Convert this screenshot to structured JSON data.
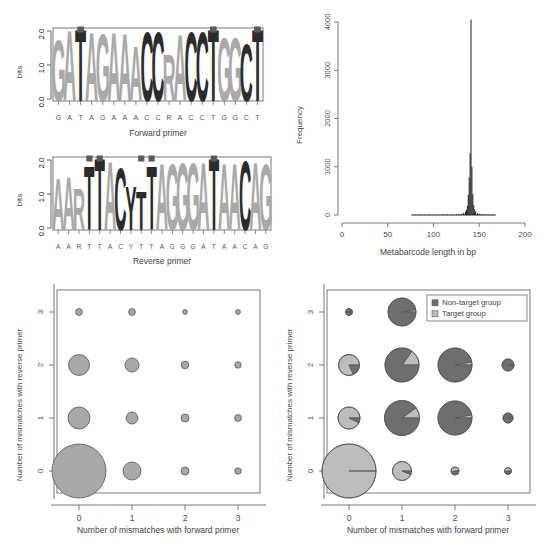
{
  "panel_a": {
    "name": "Forward primer sequence logo",
    "caption": "Forward primer",
    "ylabel": "bits",
    "yticks": [
      "0.0",
      "1.0",
      "2.0"
    ],
    "ylim": [
      0,
      2
    ],
    "sequence": "GATAGAAACCRACCTGGYT",
    "positions": [
      {
        "base": "G",
        "bits": 1.72,
        "color": "gray"
      },
      {
        "base": "A",
        "bits": 1.98,
        "color": "gray"
      },
      {
        "base": "T",
        "bits": 2.0,
        "color": "black",
        "capped": true
      },
      {
        "base": "A",
        "bits": 1.95,
        "color": "gray"
      },
      {
        "base": "G",
        "bits": 1.9,
        "color": "gray"
      },
      {
        "base": "A",
        "bits": 1.92,
        "color": "gray"
      },
      {
        "base": "A",
        "bits": 1.9,
        "color": "gray"
      },
      {
        "base": "A",
        "bits": 1.55,
        "color": "gray"
      },
      {
        "base": "C",
        "bits": 1.95,
        "color": "black"
      },
      {
        "base": "C",
        "bits": 1.92,
        "color": "black"
      },
      {
        "base": "R",
        "bits": 1.3,
        "color": "gray"
      },
      {
        "base": "A",
        "bits": 1.85,
        "color": "gray"
      },
      {
        "base": "C",
        "bits": 1.95,
        "color": "black"
      },
      {
        "base": "C",
        "bits": 1.95,
        "color": "black"
      },
      {
        "base": "T",
        "bits": 2.0,
        "color": "black",
        "capped": true
      },
      {
        "base": "G",
        "bits": 1.8,
        "color": "gray"
      },
      {
        "base": "G",
        "bits": 1.78,
        "color": "gray"
      },
      {
        "base": "C",
        "bits": 1.6,
        "color": "black"
      },
      {
        "base": "T",
        "bits": 2.0,
        "color": "black",
        "capped": true
      }
    ]
  },
  "panel_b": {
    "name": "Reverse primer sequence logo",
    "caption": "Reverse primer",
    "ylabel": "bits",
    "yticks": [
      "0.0",
      "1.0",
      "2.0"
    ],
    "ylim": [
      0,
      2
    ],
    "sequence": "AARTTACYTTAGGGATAACAG",
    "positions": [
      {
        "base": "A",
        "bits": 1.45,
        "color": "gray"
      },
      {
        "base": "A",
        "bits": 1.5,
        "color": "gray"
      },
      {
        "base": "R",
        "bits": 1.15,
        "color": "gray"
      },
      {
        "base": "T",
        "bits": 1.8,
        "color": "black",
        "capped": true
      },
      {
        "base": "T",
        "bits": 2.0,
        "color": "black",
        "capped": true
      },
      {
        "base": "A",
        "bits": 1.95,
        "color": "gray"
      },
      {
        "base": "C",
        "bits": 1.75,
        "color": "black"
      },
      {
        "base": "Y",
        "bits": 1.25,
        "color": "black"
      },
      {
        "base": "T",
        "bits": 1.1,
        "color": "black",
        "capped": true
      },
      {
        "base": "T",
        "bits": 1.8,
        "color": "black",
        "capped": true
      },
      {
        "base": "A",
        "bits": 1.85,
        "color": "gray"
      },
      {
        "base": "G",
        "bits": 1.85,
        "color": "gray"
      },
      {
        "base": "G",
        "bits": 1.9,
        "color": "gray"
      },
      {
        "base": "G",
        "bits": 1.9,
        "color": "gray"
      },
      {
        "base": "A",
        "bits": 1.9,
        "color": "gray"
      },
      {
        "base": "T",
        "bits": 2.0,
        "color": "black",
        "capped": true
      },
      {
        "base": "A",
        "bits": 1.85,
        "color": "gray"
      },
      {
        "base": "A",
        "bits": 1.85,
        "color": "gray"
      },
      {
        "base": "C",
        "bits": 1.95,
        "color": "black"
      },
      {
        "base": "A",
        "bits": 1.9,
        "color": "gray"
      },
      {
        "base": "G",
        "bits": 1.85,
        "color": "gray"
      }
    ]
  },
  "panel_c": {
    "name": "Metabarcode length histogram",
    "xlabel": "Metabarcode length in bp",
    "ylabel": "Frequency",
    "xticks": [
      "0",
      "50",
      "100",
      "150",
      "200"
    ],
    "yticks": [
      "0",
      "1000",
      "2000",
      "3000",
      "4000"
    ],
    "xlim": [
      0,
      200
    ],
    "ylim": [
      0,
      4000
    ],
    "chart_data": {
      "type": "bar",
      "title": "",
      "xlabel": "Metabarcode length in bp",
      "ylabel": "Frequency",
      "xlim": [
        0,
        200
      ],
      "ylim": [
        0,
        4000
      ],
      "grid": false,
      "bin_width": 1,
      "bins": [
        {
          "x": 76,
          "y": 5
        },
        {
          "x": 80,
          "y": 6
        },
        {
          "x": 85,
          "y": 6
        },
        {
          "x": 90,
          "y": 7
        },
        {
          "x": 95,
          "y": 8
        },
        {
          "x": 100,
          "y": 8
        },
        {
          "x": 105,
          "y": 9
        },
        {
          "x": 110,
          "y": 10
        },
        {
          "x": 115,
          "y": 12
        },
        {
          "x": 120,
          "y": 14
        },
        {
          "x": 125,
          "y": 18
        },
        {
          "x": 128,
          "y": 22
        },
        {
          "x": 131,
          "y": 30
        },
        {
          "x": 133,
          "y": 45
        },
        {
          "x": 135,
          "y": 70
        },
        {
          "x": 136,
          "y": 110
        },
        {
          "x": 137,
          "y": 190
        },
        {
          "x": 138,
          "y": 420
        },
        {
          "x": 139,
          "y": 780
        },
        {
          "x": 140,
          "y": 1280
        },
        {
          "x": 141,
          "y": 4050
        },
        {
          "x": 142,
          "y": 1000
        },
        {
          "x": 143,
          "y": 430
        },
        {
          "x": 144,
          "y": 210
        },
        {
          "x": 145,
          "y": 120
        },
        {
          "x": 146,
          "y": 70
        },
        {
          "x": 148,
          "y": 40
        },
        {
          "x": 150,
          "y": 25
        },
        {
          "x": 152,
          "y": 18
        },
        {
          "x": 155,
          "y": 14
        },
        {
          "x": 158,
          "y": 10
        },
        {
          "x": 161,
          "y": 8
        },
        {
          "x": 164,
          "y": 6
        },
        {
          "x": 167,
          "y": 5
        }
      ]
    }
  },
  "panel_d": {
    "name": "Mismatch bubble plot",
    "xlabel": "Number of mismatches with forward primer",
    "ylabel": "Number of mismatches with reverse primer",
    "xticks": [
      "0",
      "1",
      "2",
      "3"
    ],
    "yticks": [
      "0",
      "1",
      "2",
      "3"
    ],
    "chart_data": {
      "type": "scatter",
      "title": "",
      "xlabel": "Number of mismatches with forward primer",
      "ylabel": "Number of mismatches with reverse primer",
      "xlim": [
        0,
        3
      ],
      "ylim": [
        0,
        3
      ],
      "grid": false,
      "marker": "bubble",
      "bubble_color": "#a8a8a8",
      "bubbles": [
        {
          "x": 0,
          "y": 0,
          "r": 27.0
        },
        {
          "x": 1,
          "y": 0,
          "r": 9.0
        },
        {
          "x": 2,
          "y": 0,
          "r": 4.0
        },
        {
          "x": 3,
          "y": 0,
          "r": 3.2
        },
        {
          "x": 0,
          "y": 1,
          "r": 11.0
        },
        {
          "x": 1,
          "y": 1,
          "r": 6.0
        },
        {
          "x": 2,
          "y": 1,
          "r": 4.0
        },
        {
          "x": 3,
          "y": 1,
          "r": 3.4
        },
        {
          "x": 0,
          "y": 2,
          "r": 10.5
        },
        {
          "x": 1,
          "y": 2,
          "r": 7.0
        },
        {
          "x": 2,
          "y": 2,
          "r": 3.8
        },
        {
          "x": 3,
          "y": 2,
          "r": 3.2
        },
        {
          "x": 0,
          "y": 3,
          "r": 3.4
        },
        {
          "x": 1,
          "y": 3,
          "r": 3.4
        },
        {
          "x": 2,
          "y": 3,
          "r": 2.4
        },
        {
          "x": 3,
          "y": 3,
          "r": 2.4
        }
      ]
    }
  },
  "panel_e": {
    "name": "Mismatch pie plot",
    "xlabel": "Number of mismatches with forward primer",
    "ylabel": "Number of mismatches with reverse primer",
    "xticks": [
      "0",
      "1",
      "2",
      "3"
    ],
    "yticks": [
      "0",
      "1",
      "2",
      "3"
    ],
    "legend": {
      "position": "top-right",
      "items": [
        {
          "label": "Non-target group",
          "color": "#6e6e6e"
        },
        {
          "label": "Target group",
          "color": "#bdbdbd"
        }
      ]
    },
    "chart_data": {
      "type": "pie",
      "title": "",
      "xlabel": "Number of mismatches with forward primer",
      "ylabel": "Number of mismatches with reverse primer",
      "xlim": [
        0,
        3
      ],
      "ylim": [
        0,
        3
      ],
      "grid": false,
      "series": [
        {
          "name": "Non-target group",
          "color": "#6e6e6e"
        },
        {
          "name": "Target group",
          "color": "#bdbdbd"
        }
      ],
      "pies": [
        {
          "x": 0,
          "y": 0,
          "r": 27.0,
          "target": 1.0,
          "nontarget": 0.0
        },
        {
          "x": 1,
          "y": 0,
          "r": 9.5,
          "target": 0.94,
          "nontarget": 0.06
        },
        {
          "x": 2,
          "y": 0,
          "r": 4.0,
          "target": 0.55,
          "nontarget": 0.45
        },
        {
          "x": 3,
          "y": 0,
          "r": 3.4,
          "target": 0.55,
          "nontarget": 0.45
        },
        {
          "x": 0,
          "y": 1,
          "r": 11.0,
          "target": 0.93,
          "nontarget": 0.07
        },
        {
          "x": 1,
          "y": 1,
          "r": 17.5,
          "target": 0.1,
          "nontarget": 0.9
        },
        {
          "x": 2,
          "y": 1,
          "r": 17.0,
          "target": 0.03,
          "nontarget": 0.97
        },
        {
          "x": 3,
          "y": 1,
          "r": 5.0,
          "target": 0.05,
          "nontarget": 0.95
        },
        {
          "x": 0,
          "y": 2,
          "r": 10.5,
          "target": 0.82,
          "nontarget": 0.18
        },
        {
          "x": 1,
          "y": 2,
          "r": 17.0,
          "target": 0.15,
          "nontarget": 0.85
        },
        {
          "x": 2,
          "y": 2,
          "r": 17.0,
          "target": 0.03,
          "nontarget": 0.97
        },
        {
          "x": 3,
          "y": 2,
          "r": 6.0,
          "target": 0.02,
          "nontarget": 0.98
        },
        {
          "x": 0,
          "y": 3,
          "r": 3.4,
          "target": 0.05,
          "nontarget": 0.95
        },
        {
          "x": 1,
          "y": 3,
          "r": 14.0,
          "target": 0.03,
          "nontarget": 0.97
        },
        {
          "x": 2,
          "y": 3,
          "r": 6.5,
          "target": 0.03,
          "nontarget": 0.97
        },
        {
          "x": 3,
          "y": 3,
          "r": 6.5,
          "target": 0.03,
          "nontarget": 0.97
        }
      ]
    }
  }
}
